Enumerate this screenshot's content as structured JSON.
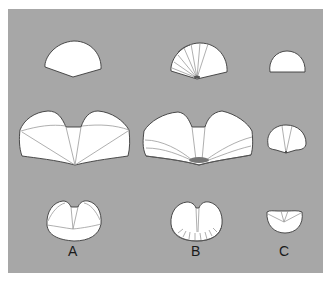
{
  "figure": {
    "background_color": "#a7a7a7",
    "shape_fill": "#ffffff",
    "columns": [
      {
        "label": "A",
        "rows": [
          "top-dome",
          "wide-bilobed-with-radial-lines",
          "round-notched-with-radial-lines"
        ]
      },
      {
        "label": "B",
        "rows": [
          "fan-with-radial-lines",
          "wide-bilobed-with-curved-lines-and-dark-apex",
          "round-notched-with-marginal-ticks"
        ]
      },
      {
        "label": "C",
        "rows": [
          "small-dome",
          "oval-with-two-lines",
          "bowl-with-triangle-lines"
        ]
      }
    ]
  },
  "labels": {
    "a": "A",
    "b": "B",
    "c": "C"
  }
}
